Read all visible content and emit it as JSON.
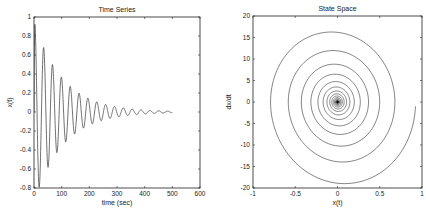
{
  "figure": {
    "width": 426,
    "height": 212,
    "background": "#ffffff",
    "line_color": "#333333"
  },
  "chart_data": [
    {
      "type": "line",
      "title": "Time Series",
      "xlabel": "time (sec)",
      "ylabel": "x(t)",
      "xlim": [
        0,
        600
      ],
      "ylim": [
        -0.8,
        1
      ],
      "xticks": [
        0,
        100,
        200,
        300,
        400,
        500,
        600
      ],
      "xtick_labels": [
        "0",
        "100",
        "200",
        "300",
        "400",
        "500",
        "600"
      ],
      "yticks": [
        -0.8,
        -0.6,
        -0.4,
        -0.2,
        0,
        0.2,
        0.4,
        0.6,
        0.8,
        1
      ],
      "ytick_labels": [
        "-0.8",
        "-0.6",
        "-0.4",
        "-0.2",
        "0",
        "0.2",
        "0.4",
        "0.6",
        "0.8",
        "1"
      ],
      "grid": false,
      "series": [
        {
          "name": "x(t)",
          "model": "damped cosine",
          "amplitude": 0.95,
          "decay_time_const": 104,
          "period": 32,
          "phase_shift": 3,
          "t_range": [
            0,
            500
          ],
          "peaks": [
            {
              "t": 3,
              "x": 0.92
            },
            {
              "t": 19,
              "x": -0.82
            },
            {
              "t": 35,
              "x": 0.68
            },
            {
              "t": 51,
              "x": -0.58
            },
            {
              "t": 67,
              "x": 0.5
            },
            {
              "t": 83,
              "x": -0.42
            },
            {
              "t": 99,
              "x": 0.37
            },
            {
              "t": 115,
              "x": -0.3
            },
            {
              "t": 131,
              "x": 0.27
            },
            {
              "t": 147,
              "x": -0.22
            },
            {
              "t": 163,
              "x": 0.2
            },
            {
              "t": 195,
              "x": 0.15
            },
            {
              "t": 227,
              "x": 0.11
            },
            {
              "t": 259,
              "x": 0.08
            },
            {
              "t": 291,
              "x": 0.06
            },
            {
              "t": 323,
              "x": 0.04
            },
            {
              "t": 500,
              "x": 0.0
            }
          ]
        }
      ]
    },
    {
      "type": "line",
      "title": "State Space",
      "xlabel": "x(t)",
      "ylabel": "dx/dt",
      "xlim": [
        -1,
        1
      ],
      "ylim": [
        -20,
        20
      ],
      "xticks": [
        -1,
        -0.5,
        0,
        0.5,
        1
      ],
      "xtick_labels": [
        "-1",
        "-0.5",
        "0",
        "0.5",
        "1"
      ],
      "yticks": [
        -20,
        -15,
        -10,
        -5,
        0,
        5,
        10,
        15,
        20
      ],
      "ytick_labels": [
        "-20",
        "-15",
        "-10",
        "-5",
        "0",
        "5",
        "10",
        "15",
        "20"
      ],
      "grid": false,
      "series": [
        {
          "name": "trajectory (x, dx/dt)",
          "model": "inward spiral toward origin",
          "velocity_scale": 21,
          "outer_loop_extent": {
            "x": [
              -0.78,
              0.92
            ],
            "dxdt": [
              -17,
              20
            ]
          }
        }
      ]
    }
  ]
}
